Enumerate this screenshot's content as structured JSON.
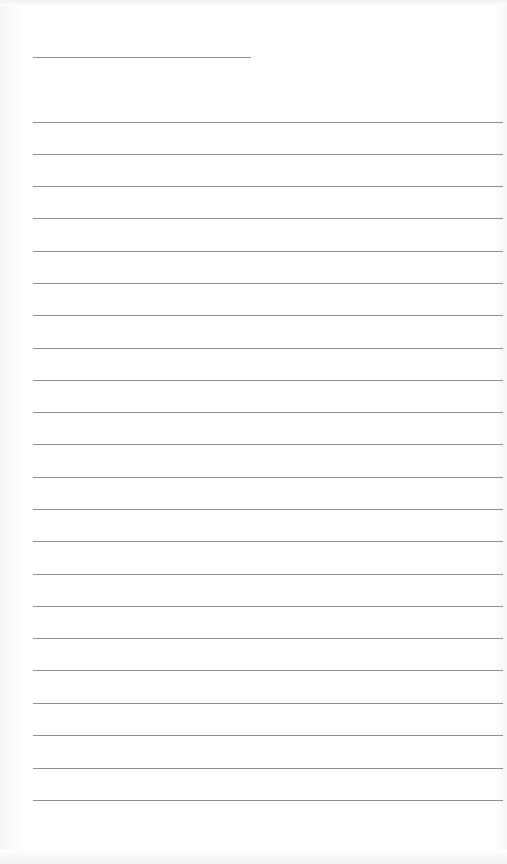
{
  "page": {
    "type": "lined-paper",
    "background": "#ffffff",
    "rule_color": "#8f8f8f",
    "header_rule": {
      "x": 33,
      "y": 57,
      "width": 218
    },
    "rules": {
      "x": 33,
      "width": 470,
      "y_positions": [
        122,
        154,
        186,
        218,
        251,
        283,
        315,
        348,
        380,
        412,
        444,
        477,
        509,
        541,
        574,
        606,
        638,
        670,
        703,
        735,
        768,
        800
      ]
    }
  }
}
